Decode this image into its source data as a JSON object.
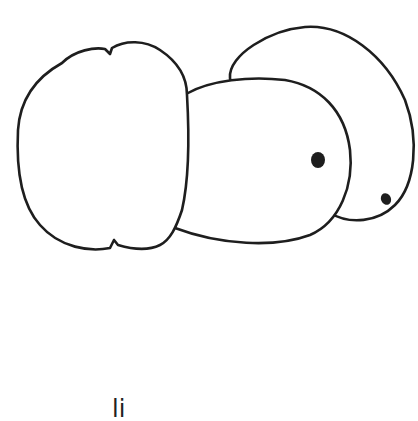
{
  "drawing": {
    "style": "hand-drawn line sketch",
    "stroke_color": "#1e1e1e",
    "background": "#ffffff",
    "shapes": [
      {
        "name": "left-blob",
        "description": "large rounded square-ish blob with notches at top and bottom"
      },
      {
        "name": "middle-blob",
        "description": "oval blob with a filled dot (eye)"
      },
      {
        "name": "right-blob",
        "description": "back oval blob with a smaller filled dot"
      }
    ]
  },
  "caption": {
    "text": "li"
  }
}
